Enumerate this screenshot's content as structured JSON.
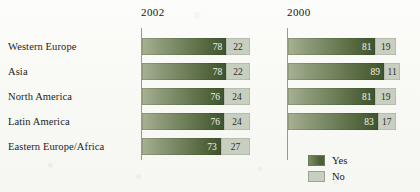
{
  "chart_data": {
    "type": "bar",
    "title": "",
    "xlabel": "",
    "ylabel": "",
    "orientation": "horizontal",
    "stacked": true,
    "xlim": [
      0,
      100
    ],
    "grid": false,
    "legend_position": "bottom-right",
    "categories": [
      "Western Europe",
      "Asia",
      "North America",
      "Latin America",
      "Eastern Europe/Africa"
    ],
    "groups": [
      {
        "name": "2002",
        "rows": [
          {
            "category": "Western Europe",
            "yes": 78,
            "no": 22
          },
          {
            "category": "Asia",
            "yes": 78,
            "no": 22
          },
          {
            "category": "North America",
            "yes": 76,
            "no": 24
          },
          {
            "category": "Latin America",
            "yes": 76,
            "no": 24
          },
          {
            "category": "Eastern Europe/Africa",
            "yes": 73,
            "no": 27
          }
        ]
      },
      {
        "name": "2000",
        "rows": [
          {
            "category": "Western Europe",
            "yes": 81,
            "no": 19
          },
          {
            "category": "Asia",
            "yes": 89,
            "no": 11
          },
          {
            "category": "North America",
            "yes": 81,
            "no": 19
          },
          {
            "category": "Latin America",
            "yes": 83,
            "no": 17
          },
          {
            "category": "Eastern Europe/Africa",
            "yes": null,
            "no": null
          }
        ]
      }
    ],
    "series": [
      {
        "name": "Yes",
        "color": "#4e6138"
      },
      {
        "name": "No",
        "color": "#c9cfc0"
      }
    ]
  },
  "legend": {
    "items": [
      {
        "label": "Yes",
        "color": "#4e6138"
      },
      {
        "label": "No",
        "color": "#c9cfc0"
      }
    ]
  },
  "colors": {
    "yes_dark": "#4e6138",
    "yes_light": "#a7b193",
    "no": "#c9cfc0",
    "axis": "#9a9a90",
    "text": "#1d1d1b",
    "background": "#fbfbf8"
  }
}
